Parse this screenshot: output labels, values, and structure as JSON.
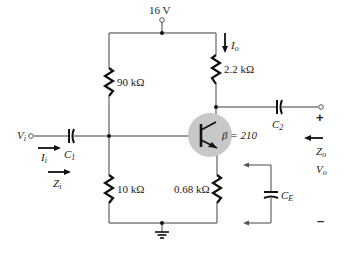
{
  "supply": {
    "label": "16 V"
  },
  "resistors": {
    "r1": {
      "label": "90 kΩ"
    },
    "r2": {
      "label": "10 kΩ"
    },
    "rc": {
      "label": "2.2 kΩ"
    },
    "re": {
      "label": "0.68 kΩ"
    }
  },
  "transistor": {
    "beta_label": "β = 210"
  },
  "capacitors": {
    "c1": {
      "letter": "C",
      "sub": "1"
    },
    "c2": {
      "letter": "C",
      "sub": "2"
    },
    "ce": {
      "letter": "C",
      "sub": "E"
    }
  },
  "input": {
    "vi": {
      "letter": "V",
      "sub": "i"
    },
    "ii": {
      "letter": "I",
      "sub": "i"
    },
    "zi": {
      "letter": "Z",
      "sub": "i"
    }
  },
  "output": {
    "io": {
      "letter": "I",
      "sub": "o"
    },
    "zo": {
      "letter": "Z",
      "sub": "o"
    },
    "vo": {
      "letter": "V",
      "sub": "o"
    },
    "plus": "+",
    "minus": "–"
  },
  "colors": {
    "wire": "#7a7a7a",
    "component": "#111111",
    "transistor_fill": "#c8c8c8"
  }
}
